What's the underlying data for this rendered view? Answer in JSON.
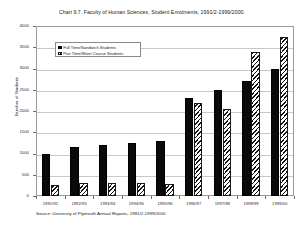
{
  "chart_data": {
    "type": "bar",
    "title": "Chart 9.7. Faculty of Human Sciences, Student Enrolments, 1991/2-1999/2000.",
    "xlabel": "",
    "ylabel": "Number of Students",
    "ylim": [
      0,
      4000
    ],
    "ytick_values": [
      4000,
      3500,
      3000,
      2500,
      2000,
      1500,
      1000,
      500,
      0
    ],
    "ytick_labels": [
      "4000",
      "3500",
      "3000",
      "2500",
      "2000",
      "1500",
      "1000",
      "500",
      "0"
    ],
    "grid": true,
    "legend_position": "upper left inside",
    "categories": [
      "1991/92",
      "1992/93",
      "1993/94",
      "1994/95",
      "1995/96",
      "1996/97",
      "1997/98",
      "1998/99",
      "1999/00"
    ],
    "series": [
      {
        "name": "Full Time/Sandwich Students",
        "color": "#0a0a0a",
        "fill": "solid",
        "values": [
          1000,
          1150,
          1200,
          1250,
          1300,
          2300,
          2500,
          2700,
          3000
        ]
      },
      {
        "name": "Part Time/Short Course Students",
        "color": "#1a1a1a",
        "fill": "diagonal-hatch",
        "values": [
          250,
          300,
          300,
          300,
          280,
          2200,
          2050,
          3400,
          3750
        ]
      }
    ],
    "source": "Source: University of Plymouth Annual Reports, 1991/2-1999/2000"
  }
}
